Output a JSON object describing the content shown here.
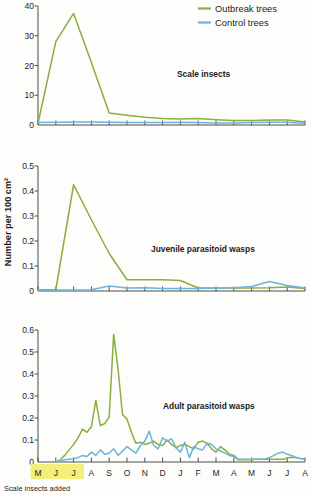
{
  "figure": {
    "ylabel": "Number per 100 cm²",
    "caption": "Scale insects added",
    "highlight_color": "#f2f07a",
    "highlight_months": [
      "M",
      "J",
      "J"
    ],
    "months": [
      "M",
      "J",
      "J",
      "A",
      "S",
      "O",
      "N",
      "D",
      "J",
      "F",
      "M",
      "A",
      "M",
      "J",
      "J",
      "A"
    ]
  },
  "legend": {
    "position": "top-right",
    "items": [
      {
        "label": "Outbreak trees",
        "color": "#8aaf3c"
      },
      {
        "label": "Control trees",
        "color": "#6cb3dd"
      }
    ]
  },
  "chart_data": [
    {
      "type": "line",
      "title": "Scale insects",
      "xlabel": "",
      "ylabel": "Number per 100 cm²",
      "ylim": [
        0,
        40
      ],
      "yticks": [
        0,
        10,
        20,
        30,
        40
      ],
      "ytick_labels": [
        "0",
        "10",
        "20",
        "30",
        "40"
      ],
      "grid": false,
      "x": [
        "M",
        "J",
        "J",
        "A",
        "S",
        "O",
        "N",
        "D",
        "J",
        "F",
        "M",
        "A",
        "M",
        "J",
        "J",
        "A"
      ],
      "series": [
        {
          "name": "Outbreak trees",
          "color": "#8aaf3c",
          "values": [
            0.5,
            28.0,
            37.5,
            21.0,
            4.0,
            3.3,
            2.6,
            2.2,
            2.0,
            2.2,
            1.8,
            1.5,
            1.5,
            1.7,
            1.7,
            1.0
          ]
        },
        {
          "name": "Control trees",
          "color": "#6cb3dd",
          "values": [
            0.8,
            0.9,
            1.0,
            1.0,
            0.9,
            0.8,
            0.8,
            0.8,
            0.9,
            0.8,
            0.7,
            0.7,
            0.8,
            0.9,
            0.9,
            0.6
          ]
        }
      ]
    },
    {
      "type": "line",
      "title": "Juvenile parasitoid wasps",
      "xlabel": "",
      "ylabel": "Number per 100 cm²",
      "ylim": [
        0,
        0.5
      ],
      "yticks": [
        0,
        0.1,
        0.2,
        0.3,
        0.4,
        0.5
      ],
      "ytick_labels": [
        "0",
        "0.1",
        "0.2",
        "0.3",
        "0.4",
        "0.5"
      ],
      "grid": false,
      "x": [
        "M",
        "J",
        "J",
        "A",
        "S",
        "O",
        "N",
        "D",
        "J",
        "F",
        "M",
        "A",
        "M",
        "J",
        "J",
        "A"
      ],
      "series": [
        {
          "name": "Outbreak trees",
          "color": "#8aaf3c",
          "values": [
            0.005,
            0.005,
            0.425,
            0.285,
            0.15,
            0.045,
            0.045,
            0.045,
            0.042,
            0.012,
            0.012,
            0.012,
            0.012,
            0.013,
            0.016,
            0.01
          ]
        },
        {
          "name": "Control trees",
          "color": "#6cb3dd",
          "values": [
            0.004,
            0.004,
            0.004,
            0.005,
            0.02,
            0.012,
            0.013,
            0.01,
            0.01,
            0.01,
            0.012,
            0.013,
            0.018,
            0.038,
            0.022,
            0.012
          ]
        }
      ]
    },
    {
      "type": "line",
      "title": "Adult parasitoid wasps",
      "xlabel": "",
      "ylabel": "Number per 100 cm²",
      "ylim": [
        0,
        0.6
      ],
      "yticks": [
        0,
        0.1,
        0.2,
        0.3,
        0.4,
        0.5,
        0.6
      ],
      "ytick_labels": [
        "0",
        "0.1",
        "0.2",
        "0.3",
        "0.4",
        "0.5",
        "0.6"
      ],
      "grid": false,
      "x_start_month_index": 1,
      "x": [
        "M",
        "J",
        "J",
        "A",
        "S",
        "O",
        "N",
        "D",
        "J",
        "F",
        "M",
        "A",
        "M",
        "J",
        "J",
        "A"
      ],
      "series": [
        {
          "name": "Outbreak trees",
          "color": "#8aaf3c",
          "values": [
            0.0,
            0.01,
            0.03,
            0.055,
            0.08,
            0.11,
            0.15,
            0.135,
            0.16,
            0.28,
            0.165,
            0.175,
            0.205,
            0.58,
            0.42,
            0.215,
            0.195,
            0.135,
            0.085,
            0.09,
            0.08,
            0.085,
            0.095,
            0.08,
            0.075,
            0.1,
            0.08,
            0.065,
            0.075,
            0.08,
            0.07,
            0.06,
            0.09,
            0.095,
            0.085,
            0.06,
            0.045,
            0.07,
            0.055,
            0.035,
            0.03,
            0.01,
            0.01,
            0.01,
            0.01,
            0.012,
            0.012,
            0.012,
            0.012,
            0.012,
            0.012,
            0.012,
            0.018,
            0.022,
            0.02,
            0.016,
            0.014
          ]
        },
        {
          "name": "Control trees",
          "color": "#6cb3dd",
          "values": [
            0.0,
            0.005,
            0.01,
            0.012,
            0.015,
            0.02,
            0.03,
            0.025,
            0.045,
            0.03,
            0.055,
            0.035,
            0.04,
            0.06,
            0.03,
            0.05,
            0.07,
            0.055,
            0.04,
            0.075,
            0.095,
            0.14,
            0.075,
            0.06,
            0.11,
            0.095,
            0.105,
            0.065,
            0.045,
            0.09,
            0.02,
            0.07,
            0.06,
            0.055,
            0.085,
            0.08,
            0.06,
            0.05,
            0.04,
            0.03,
            0.025,
            0.012,
            0.012,
            0.012,
            0.012,
            0.012,
            0.012,
            0.014,
            0.02,
            0.03,
            0.04,
            0.045,
            0.035,
            0.03,
            0.02,
            0.016,
            0.014
          ]
        }
      ]
    }
  ]
}
